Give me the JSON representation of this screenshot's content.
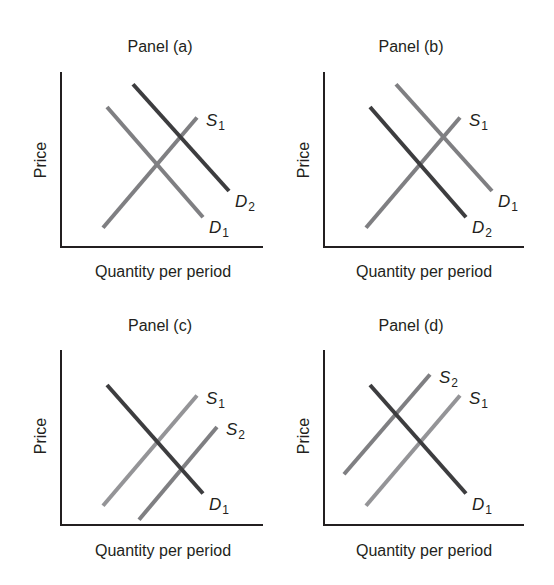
{
  "figure": {
    "colors": {
      "background": "#ffffff",
      "axis": "#231f20",
      "text": "#231f20",
      "dark_curve": "#3d3d3f",
      "mid_curve": "#7f7f82",
      "light_curve": "#949497"
    }
  },
  "chart_data": [
    {
      "type": "line",
      "panel": "a",
      "title": "Panel (a)",
      "xlabel": "Quantity per period",
      "ylabel": "Price",
      "grid": false,
      "description": "Demand increases from D1 to D2 with supply S1 unchanged",
      "series": [
        {
          "name": "S1",
          "base": "S",
          "sub": "1",
          "kind": "supply",
          "tone": "mid",
          "points": [
            [
              0.21,
              0.11
            ],
            [
              0.68,
              0.74
            ]
          ]
        },
        {
          "name": "D1",
          "base": "D",
          "sub": "1",
          "kind": "demand",
          "tone": "mid",
          "points": [
            [
              0.23,
              0.8
            ],
            [
              0.71,
              0.17
            ]
          ]
        },
        {
          "name": "D2",
          "base": "D",
          "sub": "2",
          "kind": "demand",
          "tone": "dark",
          "points": [
            [
              0.36,
              0.93
            ],
            [
              0.84,
              0.32
            ]
          ]
        }
      ]
    },
    {
      "type": "line",
      "panel": "b",
      "title": "Panel (b)",
      "xlabel": "Quantity per period",
      "ylabel": "Price",
      "grid": false,
      "description": "Demand decreases from D1 to D2 with supply S1 unchanged",
      "series": [
        {
          "name": "S1",
          "base": "S",
          "sub": "1",
          "kind": "supply",
          "tone": "mid",
          "points": [
            [
              0.21,
              0.11
            ],
            [
              0.68,
              0.74
            ]
          ]
        },
        {
          "name": "D1",
          "base": "D",
          "sub": "1",
          "kind": "demand",
          "tone": "mid",
          "points": [
            [
              0.36,
              0.93
            ],
            [
              0.84,
              0.32
            ]
          ]
        },
        {
          "name": "D2",
          "base": "D",
          "sub": "2",
          "kind": "demand",
          "tone": "dark",
          "points": [
            [
              0.23,
              0.8
            ],
            [
              0.71,
              0.17
            ]
          ]
        }
      ]
    },
    {
      "type": "line",
      "panel": "c",
      "title": "Panel (c)",
      "xlabel": "Quantity per period",
      "ylabel": "Price",
      "grid": false,
      "description": "Supply increases from S1 to S2 with demand D1 unchanged",
      "series": [
        {
          "name": "S1",
          "base": "S",
          "sub": "1",
          "kind": "supply",
          "tone": "light",
          "points": [
            [
              0.21,
              0.11
            ],
            [
              0.68,
              0.74
            ]
          ]
        },
        {
          "name": "S2",
          "base": "S",
          "sub": "2",
          "kind": "supply",
          "tone": "mid",
          "points": [
            [
              0.39,
              0.03
            ],
            [
              0.78,
              0.56
            ]
          ]
        },
        {
          "name": "D1",
          "base": "D",
          "sub": "1",
          "kind": "demand",
          "tone": "dark",
          "points": [
            [
              0.23,
              0.8
            ],
            [
              0.71,
              0.18
            ]
          ]
        }
      ]
    },
    {
      "type": "line",
      "panel": "d",
      "title": "Panel (d)",
      "xlabel": "Quantity per period",
      "ylabel": "Price",
      "grid": false,
      "description": "Supply decreases from S1 to S2 with demand D1 unchanged",
      "series": [
        {
          "name": "S1",
          "base": "S",
          "sub": "1",
          "kind": "supply",
          "tone": "light",
          "points": [
            [
              0.21,
              0.11
            ],
            [
              0.68,
              0.74
            ]
          ]
        },
        {
          "name": "S2",
          "base": "S",
          "sub": "2",
          "kind": "supply",
          "tone": "mid",
          "points": [
            [
              0.1,
              0.29
            ],
            [
              0.53,
              0.86
            ]
          ]
        },
        {
          "name": "D1",
          "base": "D",
          "sub": "1",
          "kind": "demand",
          "tone": "dark",
          "points": [
            [
              0.23,
              0.8
            ],
            [
              0.71,
              0.18
            ]
          ]
        }
      ]
    }
  ]
}
